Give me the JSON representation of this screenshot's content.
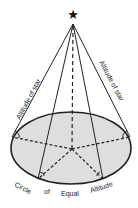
{
  "diagram": {
    "labels": {
      "altitude_left": "Altitude of star",
      "altitude_right": "Altitude of star",
      "circle_word1": "Circle",
      "circle_word2": "of",
      "circle_word3": "Equal",
      "circle_word4": "Altitude"
    },
    "icons": {
      "star": "★"
    },
    "colors": {
      "line": "#222222",
      "ellipse_fill": "#dedede",
      "background": "#ffffff"
    }
  }
}
